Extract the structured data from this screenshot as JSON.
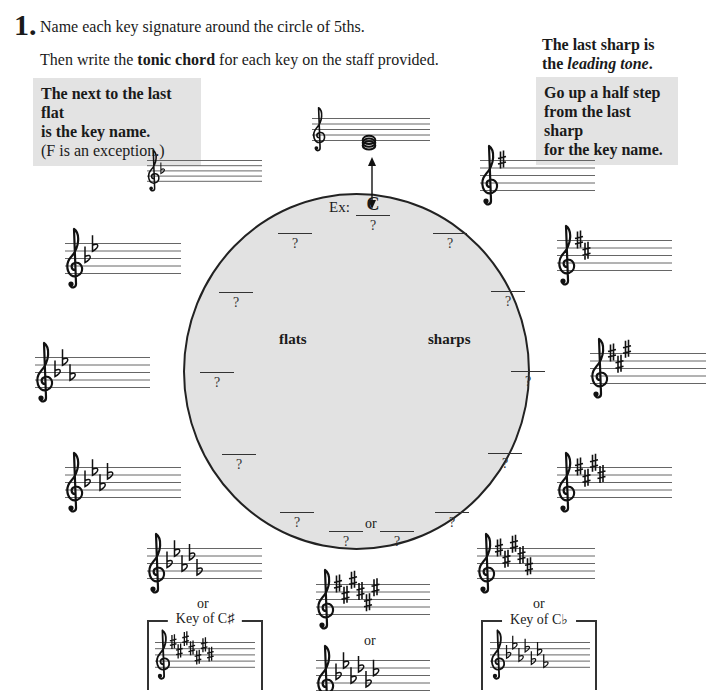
{
  "exercise": {
    "number": "1.",
    "line1": "Name each key signature around the circle of 5ths.",
    "line2_pre": "Then write the ",
    "line2_bold": "tonic chord",
    "line2_post": " for each key on the staff provided."
  },
  "flat_tip": {
    "bold1": "The next to the last flat",
    "bold2": "is the key name.",
    "normal": "(F is an exception.)"
  },
  "sharp_tip": {
    "heading1": "The last sharp is",
    "heading2_pre": "the ",
    "heading2_italic": "leading tone",
    "heading2_post": ".",
    "box1": "Go up a half step",
    "box2": "from the last sharp",
    "box3": "for the key name."
  },
  "circle": {
    "example_prefix": "Ex:",
    "example_answer": "C",
    "placeholder": "?",
    "flats_label": "flats",
    "sharps_label": "sharps",
    "or_label": "or"
  },
  "labels": {
    "or": "or",
    "key_of_csharp": "Key of C♯",
    "key_of_cflat": "Key of C♭"
  },
  "staves": [
    {
      "id": "c-major",
      "accidental": "none",
      "count": 0,
      "chord": "C-E-G"
    },
    {
      "id": "one-flat",
      "accidental": "flat",
      "count": 1
    },
    {
      "id": "two-flats",
      "accidental": "flat",
      "count": 2
    },
    {
      "id": "three-flats",
      "accidental": "flat",
      "count": 3
    },
    {
      "id": "four-flats",
      "accidental": "flat",
      "count": 4
    },
    {
      "id": "five-flats",
      "accidental": "flat",
      "count": 5
    },
    {
      "id": "six-flats",
      "accidental": "flat",
      "count": 6
    },
    {
      "id": "seven-sharps",
      "accidental": "sharp",
      "count": 7
    },
    {
      "id": "one-sharp",
      "accidental": "sharp",
      "count": 1
    },
    {
      "id": "two-sharps",
      "accidental": "sharp",
      "count": 2
    },
    {
      "id": "three-sharps",
      "accidental": "sharp",
      "count": 3
    },
    {
      "id": "four-sharps",
      "accidental": "sharp",
      "count": 4
    },
    {
      "id": "five-sharps",
      "accidental": "sharp",
      "count": 5
    },
    {
      "id": "six-sharps",
      "accidental": "sharp",
      "count": 6
    },
    {
      "id": "seven-flats",
      "accidental": "flat",
      "count": 7
    }
  ],
  "colors": {
    "circle_fill": "#e2e2e2",
    "tip_box": "#e3e3e3",
    "ink": "#1a1a1a",
    "staff_line": "#555555"
  }
}
